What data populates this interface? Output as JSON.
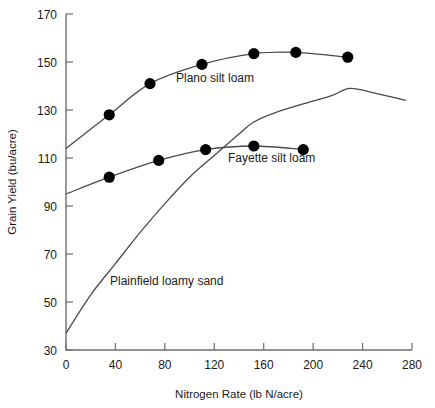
{
  "chart_data": {
    "type": "line",
    "title": "",
    "xlabel": "Nitrogen Rate (lb N/acre)",
    "ylabel": "Grain Yield (bu/acre)",
    "xlim": [
      0,
      280
    ],
    "ylim": [
      30,
      170
    ],
    "xticks": [
      0,
      40,
      80,
      120,
      160,
      200,
      240,
      280
    ],
    "yticks": [
      30,
      50,
      70,
      90,
      110,
      130,
      150,
      170
    ],
    "grid": false,
    "legend": "inline-annotations",
    "series": [
      {
        "name": "Plano silt loam",
        "markers": true,
        "annotation": "Plano silt loam",
        "x": [
          0,
          35,
          68,
          110,
          152,
          186,
          228
        ],
        "y": [
          114,
          128,
          141,
          149,
          153.5,
          154,
          152
        ]
      },
      {
        "name": "Fayette silt loam",
        "markers": true,
        "annotation": "Fayette silt loam",
        "x": [
          0,
          35,
          75,
          113,
          152,
          192
        ],
        "y": [
          95,
          102,
          109,
          113.5,
          115,
          113.5
        ]
      },
      {
        "name": "Plainfield loamy sand",
        "markers": false,
        "annotation": "Plainfield loamy sand",
        "x": [
          0,
          20,
          40,
          60,
          80,
          100,
          120,
          140,
          152,
          170,
          195,
          215,
          230,
          250,
          275
        ],
        "y": [
          37,
          53,
          66,
          79,
          91,
          102,
          111,
          120,
          125,
          129,
          133,
          136,
          139,
          137,
          134
        ]
      }
    ]
  },
  "annotations": {
    "plano": "Plano silt loam",
    "fayette": "Fayette silt loam",
    "plainfield": "Plainfield loamy sand"
  },
  "axes": {
    "x_title": "Nitrogen Rate (lb N/acre)",
    "y_title": "Grain Yield (bu/acre)",
    "x_tick_labels": [
      "0",
      "40",
      "80",
      "120",
      "160",
      "200",
      "240",
      "280"
    ],
    "y_tick_labels": [
      "30",
      "50",
      "70",
      "90",
      "110",
      "130",
      "150",
      "170"
    ]
  },
  "colors": {
    "axis": "#6e6e6e",
    "curve": "#4a4a4a",
    "marker": "#000000",
    "text": "#1a1a1a",
    "background": "#ffffff"
  }
}
